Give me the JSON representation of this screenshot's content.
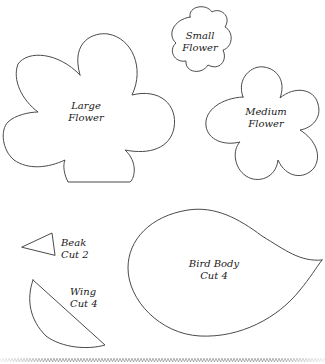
{
  "pattern": {
    "pieces": [
      {
        "id": "small-flower",
        "label_line1": "Small",
        "label_line2": "Flower"
      },
      {
        "id": "large-flower",
        "label_line1": "Large",
        "label_line2": "Flower"
      },
      {
        "id": "medium-flower",
        "label_line1": "Medium",
        "label_line2": "Flower"
      },
      {
        "id": "beak",
        "label_line1": "Beak",
        "label_line2": "Cut 2"
      },
      {
        "id": "wing",
        "label_line1": "Wing",
        "label_line2": "Cut 4"
      },
      {
        "id": "bird-body",
        "label_line1": "Bird Body",
        "label_line2": "Cut 4"
      }
    ]
  },
  "colors": {
    "background": "#ffffff",
    "outline": "#4a4a4a",
    "text": "#1a1a1a"
  }
}
